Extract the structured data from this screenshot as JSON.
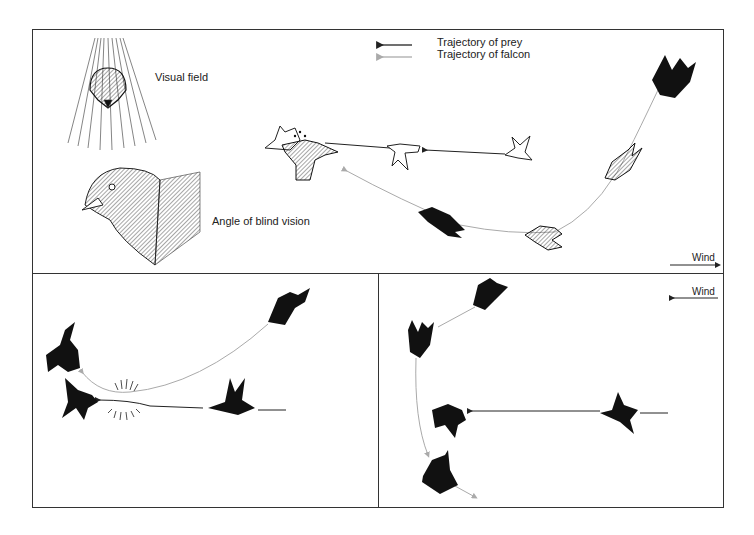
{
  "figure": {
    "top_panel": {
      "visual_field_label": "Visual field",
      "blind_angle_label": "Angle of blind vision",
      "legend": {
        "prey": "Trajectory of prey",
        "falcon": "Trajectory of falcon",
        "prey_color": "#222222",
        "falcon_color": "#aaaaaa"
      },
      "wind_label": "Wind",
      "wind_direction": "right"
    },
    "bottom_right_panel": {
      "wind_label": "Wind",
      "wind_direction": "left"
    }
  }
}
